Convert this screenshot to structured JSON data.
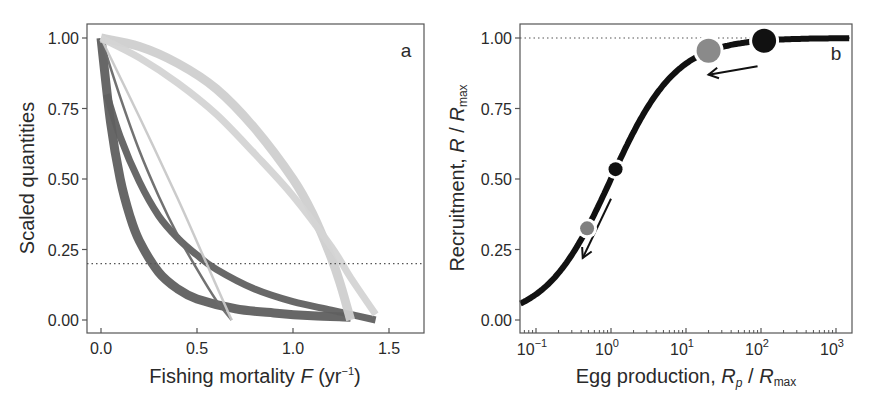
{
  "figure": {
    "caption_visible": ""
  },
  "chart_data": [
    {
      "panel": "a",
      "type": "line",
      "title": "",
      "panel_label": "a",
      "xlabel": "Fishing mortality F (yr⁻¹)",
      "xlabel_parts": {
        "main": "Fishing mortality ",
        "var": "F",
        "unit": " (yr",
        "sup": "−1",
        "close": ")"
      },
      "ylabel": "Scaled quantities",
      "xlim": [
        -0.07,
        1.68
      ],
      "ylim": [
        -0.05,
        1.05
      ],
      "xticks": [
        0.0,
        0.5,
        1.0,
        1.5
      ],
      "xtick_labels": [
        "0.0",
        "0.5",
        "1.0",
        "1.5"
      ],
      "yticks": [
        0.0,
        0.25,
        0.5,
        0.75,
        1.0
      ],
      "ytick_labels": [
        "0.00",
        "0.25",
        "0.50",
        "0.75",
        "1.00"
      ],
      "grid": false,
      "reference_line": {
        "type": "horizontal",
        "y": 0.2,
        "style": "dotted"
      },
      "series": [
        {
          "name": "dark band lower (steep decline)",
          "color": "#5f5f5f",
          "width": 9,
          "x": [
            0.0,
            0.05,
            0.1,
            0.15,
            0.2,
            0.3,
            0.4,
            0.5,
            0.7,
            0.9,
            1.1,
            1.3
          ],
          "y": [
            1.0,
            0.7,
            0.5,
            0.37,
            0.28,
            0.17,
            0.11,
            0.075,
            0.04,
            0.025,
            0.015,
            0.01
          ]
        },
        {
          "name": "dark band upper (slower decline)",
          "color": "#606060",
          "width": 7,
          "x": [
            0.03,
            0.1,
            0.2,
            0.3,
            0.4,
            0.5,
            0.6,
            0.8,
            1.0,
            1.2,
            1.43
          ],
          "y": [
            0.8,
            0.65,
            0.49,
            0.37,
            0.29,
            0.23,
            0.18,
            0.11,
            0.065,
            0.035,
            0.0
          ]
        },
        {
          "name": "dark thin line",
          "color": "#6a6a6a",
          "width": 2.5,
          "x": [
            0.0,
            0.1,
            0.2,
            0.3,
            0.4,
            0.5,
            0.6,
            0.68
          ],
          "y": [
            1.0,
            0.79,
            0.6,
            0.44,
            0.3,
            0.18,
            0.07,
            0.0
          ]
        },
        {
          "name": "light thin line",
          "color": "#c8c8c8",
          "width": 2.5,
          "x": [
            0.0,
            0.2,
            0.4,
            0.55,
            0.68
          ],
          "y": [
            1.0,
            0.72,
            0.43,
            0.2,
            0.0
          ]
        },
        {
          "name": "light band outer",
          "color": "#cfcfcf",
          "width": 9,
          "x": [
            0.0,
            0.2,
            0.4,
            0.6,
            0.8,
            1.0,
            1.1,
            1.2,
            1.25,
            1.3
          ],
          "y": [
            1.0,
            0.97,
            0.91,
            0.82,
            0.68,
            0.5,
            0.38,
            0.22,
            0.12,
            0.0
          ]
        },
        {
          "name": "light band inner",
          "color": "#d4d4d4",
          "width": 7,
          "x": [
            0.0,
            0.2,
            0.4,
            0.6,
            0.8,
            1.0,
            1.2,
            1.3,
            1.43
          ],
          "y": [
            1.0,
            0.93,
            0.84,
            0.73,
            0.59,
            0.44,
            0.26,
            0.15,
            0.02
          ]
        }
      ]
    },
    {
      "panel": "b",
      "type": "line",
      "title": "",
      "panel_label": "b",
      "xlabel": "Egg production, Rp / Rmax",
      "xlabel_parts": {
        "main": "Egg production, ",
        "var1": "R",
        "sub1": "p",
        "sep": " / ",
        "var2": "R",
        "sub2": "max"
      },
      "ylabel": "Recruitment, R / Rmax",
      "ylabel_parts": {
        "main": "Recruitment, ",
        "var1": "R",
        "sep": " / ",
        "var2": "R",
        "sub2": "max"
      },
      "xscale": "log",
      "xlim": [
        0.062,
        1500
      ],
      "ylim": [
        -0.05,
        1.05
      ],
      "xticks": [
        0.1,
        1,
        10,
        100,
        1000
      ],
      "xtick_labels": [
        {
          "base": "10",
          "exp": "−1"
        },
        {
          "base": "10",
          "exp": "0"
        },
        {
          "base": "10",
          "exp": "1"
        },
        {
          "base": "10",
          "exp": "2"
        },
        {
          "base": "10",
          "exp": "3"
        }
      ],
      "yticks": [
        0.0,
        0.25,
        0.5,
        0.75,
        1.0
      ],
      "ytick_labels": [
        "0.00",
        "0.25",
        "0.50",
        "0.75",
        "1.00"
      ],
      "grid": false,
      "reference_line": {
        "type": "horizontal",
        "y": 1.0,
        "style": "dotted"
      },
      "curve": {
        "name": "Beverton-Holt recruitment",
        "formula": "y = x / (1 + x)",
        "color": "#111111",
        "x": [
          0.062,
          0.1,
          0.2,
          0.5,
          1,
          2,
          5,
          10,
          20,
          50,
          100,
          1000
        ],
        "y": [
          0.058,
          0.091,
          0.167,
          0.333,
          0.5,
          0.667,
          0.833,
          0.909,
          0.952,
          0.98,
          0.99,
          0.999
        ]
      },
      "markers": [
        {
          "name": "grey small",
          "x": 0.48,
          "y": 0.325,
          "color": "#808080",
          "size": "small"
        },
        {
          "name": "black small",
          "x": 1.15,
          "y": 0.535,
          "color": "#111111",
          "size": "small"
        },
        {
          "name": "grey large",
          "x": 20,
          "y": 0.955,
          "color": "#8a8a8a",
          "size": "large"
        },
        {
          "name": "black large",
          "x": 110,
          "y": 0.99,
          "color": "#111111",
          "size": "large"
        }
      ],
      "annotations": [
        {
          "type": "arrow",
          "from": [
            1.0,
            0.43
          ],
          "to": [
            0.42,
            0.22
          ],
          "description": "arrow from black small to below grey small"
        },
        {
          "type": "arrow",
          "from": [
            90,
            0.9
          ],
          "to": [
            20,
            0.87
          ],
          "description": "arrow from black large toward grey large"
        }
      ]
    }
  ]
}
